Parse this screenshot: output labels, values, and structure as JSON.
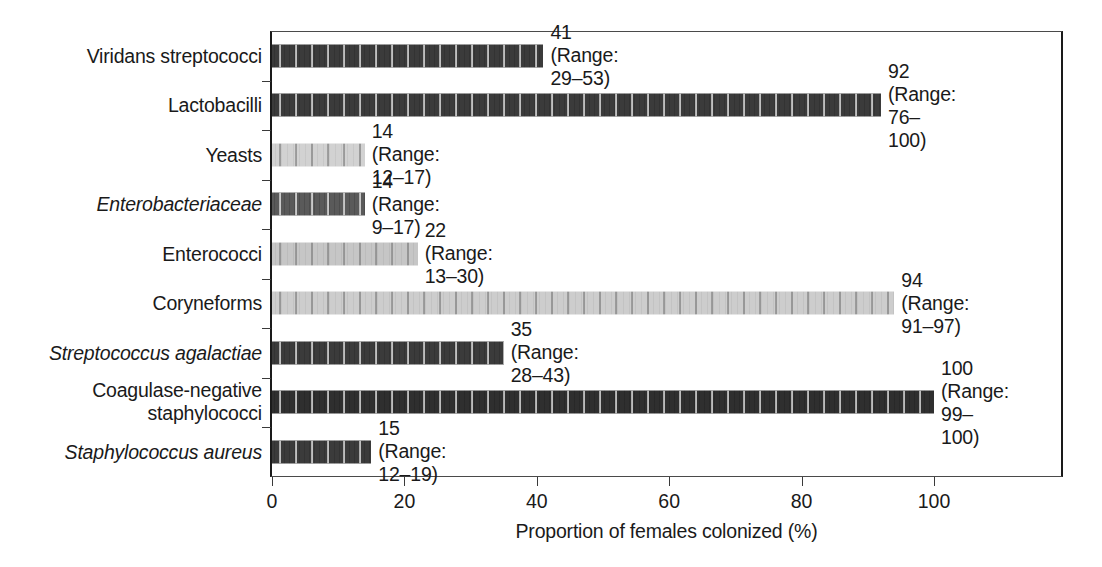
{
  "chart_data": {
    "type": "bar",
    "orientation": "horizontal",
    "title": "",
    "xlabel": "Proportion of females colonized (%)",
    "ylabel": "",
    "xlim": [
      0,
      120
    ],
    "xticks": [
      0,
      20,
      40,
      60,
      80,
      100
    ],
    "xtick_labels": [
      "0",
      "20",
      "40",
      "60",
      "80",
      "100"
    ],
    "grid": false,
    "legend": false,
    "categories": [
      "Viridans streptococci",
      "Lactobacilli",
      "Yeasts",
      "Enterobacteriaceae",
      "Enterococci",
      "Coryneforms",
      "Streptococcus agalactiae",
      "Coagulase-negative\nstaphylococci",
      "Staphylococcus aureus"
    ],
    "values": [
      41,
      92,
      14,
      14,
      22,
      94,
      35,
      100,
      15
    ],
    "ranges": [
      [
        29,
        53
      ],
      [
        76,
        100
      ],
      [
        12,
        17
      ],
      [
        9,
        17
      ],
      [
        13,
        30
      ],
      [
        91,
        97
      ],
      [
        28,
        43
      ],
      [
        99,
        100
      ],
      [
        12,
        19
      ]
    ],
    "bars": [
      {
        "category": "Viridans streptococci",
        "italic": false,
        "value": 41,
        "range_low": 29,
        "range_high": 53,
        "annotation": "41 (Range: 29–53)",
        "shade": "dark",
        "color": "#3b3b3b"
      },
      {
        "category": "Lactobacilli",
        "italic": false,
        "value": 92,
        "range_low": 76,
        "range_high": 100,
        "annotation": "92 (Range: 76–100)",
        "shade": "dark",
        "color": "#3b3b3b"
      },
      {
        "category": "Yeasts",
        "italic": false,
        "value": 14,
        "range_low": 12,
        "range_high": 17,
        "annotation": "14 (Range: 12–17)",
        "shade": "light",
        "color": "#d2d2d2"
      },
      {
        "category": "Enterobacteriaceae",
        "italic": true,
        "value": 14,
        "range_low": 9,
        "range_high": 17,
        "annotation": "14 (Range: 9–17)",
        "shade": "dark",
        "color": "#5a5a5a"
      },
      {
        "category": "Enterococci",
        "italic": false,
        "value": 22,
        "range_low": 13,
        "range_high": 30,
        "annotation": "22 (Range: 13–30)",
        "shade": "light",
        "color": "#c6c6c6"
      },
      {
        "category": "Coryneforms",
        "italic": false,
        "value": 94,
        "range_low": 91,
        "range_high": 97,
        "annotation": "94 (Range: 91–97)",
        "shade": "light",
        "color": "#cdcdcd"
      },
      {
        "category": "Streptococcus agalactiae",
        "italic": true,
        "value": 35,
        "range_low": 28,
        "range_high": 43,
        "annotation": "35 (Range: 28–43)",
        "shade": "dark",
        "color": "#3b3b3b"
      },
      {
        "category": "Coagulase-negative\nstaphylococci",
        "italic": false,
        "value": 100,
        "range_low": 99,
        "range_high": 100,
        "annotation": "100 (Range:\n99–100)",
        "shade": "dark",
        "color": "#2f2f2f"
      },
      {
        "category": "Staphylococcus aureus",
        "italic": true,
        "value": 15,
        "range_low": 12,
        "range_high": 19,
        "annotation": "15 (Range: 12–19)",
        "shade": "dark",
        "color": "#3b3b3b"
      }
    ],
    "colors": {
      "dark_bar": "#3b3b3b",
      "mid_bar": "#5a5a5a",
      "light_bar": "#cdcdcd",
      "axis": "#1a1a1a",
      "text": "#1a1a1a",
      "background": "#ffffff"
    }
  }
}
